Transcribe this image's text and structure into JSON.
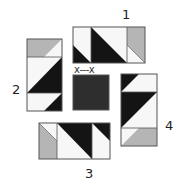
{
  "diagram": {
    "colors": {
      "black": "#141414",
      "white": "#f7f7f7",
      "gray": "#b5b5b5",
      "center": "#2e2e2e",
      "outline": "#555555"
    },
    "labels": {
      "unit1": "1",
      "unit2": "2",
      "unit3": "3",
      "unit4": "4",
      "center_mark": "x---x"
    },
    "units": [
      {
        "id": "1",
        "orientation": "horizontal",
        "position": "top",
        "cells": [
          "white/black HST",
          "black/white large triangle square",
          "gray/white HST"
        ]
      },
      {
        "id": "2",
        "orientation": "vertical",
        "position": "left",
        "cells": [
          "gray/white HST",
          "white/black large triangle square",
          "white/black HST"
        ]
      },
      {
        "id": "3",
        "orientation": "horizontal",
        "position": "bottom",
        "cells": [
          "white/gray HST",
          "white/black large triangle square",
          "white/black HST"
        ]
      },
      {
        "id": "4",
        "orientation": "vertical",
        "position": "right",
        "cells": [
          "black/white HST",
          "black/white large triangle square",
          "white/gray HST"
        ]
      }
    ],
    "center": {
      "fill": "dark square",
      "mark": "x---x"
    }
  }
}
